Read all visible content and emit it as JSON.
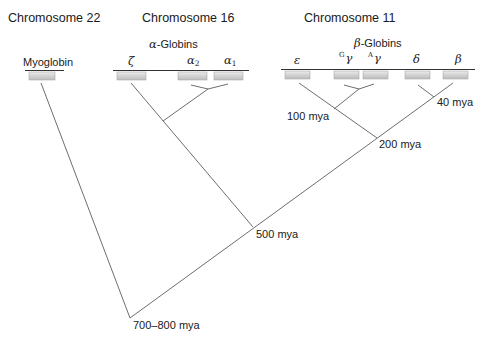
{
  "diagram": {
    "type": "gene-family-evolution-tree",
    "chromosomes": [
      {
        "title": "Chromosome 22",
        "cluster_label": "",
        "genes": [
          "Myoglobin"
        ]
      },
      {
        "title": "Chromosome 16",
        "cluster_label": "α-Globins",
        "cluster_prefix": "α",
        "cluster_suffix": "-Globins",
        "genes": [
          "ζ",
          "α2",
          "α1"
        ]
      },
      {
        "title": "Chromosome 11",
        "cluster_label": "β-Globins",
        "cluster_prefix": "β",
        "cluster_suffix": "-Globins",
        "genes": [
          "ε",
          "Gγ",
          "Aγ",
          "δ",
          "β"
        ]
      }
    ],
    "labels": {
      "chr22": "Chromosome 22",
      "chr16": "Chromosome 16",
      "chr11": "Chromosome 11",
      "myoglobin": "Myoglobin",
      "alpha_prefix": "α",
      "alpha_suffix": "-Globins",
      "beta_prefix": "β",
      "beta_suffix": "-Globins",
      "zeta": "ζ",
      "alpha": "α",
      "alpha2_sub": "2",
      "alpha1_sub": "1",
      "epsilon": "ε",
      "gamma": "γ",
      "g_sup": "G",
      "a_sup": "A",
      "delta": "δ",
      "beta": "β"
    },
    "divergence_times": {
      "d40": "40 mya",
      "d100": "100 mya",
      "d200": "200 mya",
      "d500": "500 mya",
      "d700_800": "700–800 mya"
    },
    "colors": {
      "line": "#6e6e6e",
      "chromosome_line": "#333333",
      "gene_box_fill_top": "#e4e4e4",
      "gene_box_fill_bottom": "#bdbdbd",
      "gene_box_border": "#a8a8a8",
      "text": "#1a1a1a"
    }
  }
}
